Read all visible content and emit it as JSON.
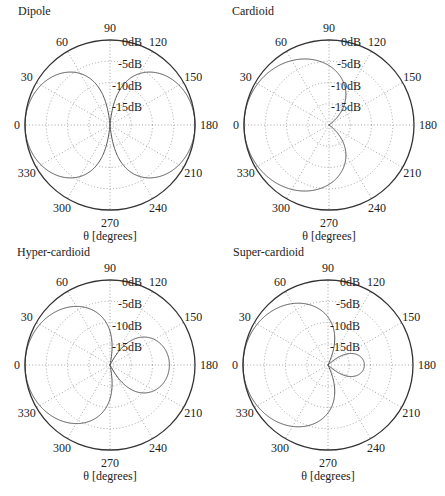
{
  "figure": {
    "angle_unit_label": "θ [degrees]"
  },
  "chart_data": [
    {
      "type": "polar",
      "title": "Dipole",
      "xlabel": "θ [degrees]",
      "pattern": {
        "a": 0.0,
        "b": 1.0,
        "formula": "|a + b·cos θ|"
      },
      "angle_ticks": [
        0,
        30,
        60,
        90,
        120,
        150,
        180,
        210,
        240,
        270,
        300,
        330
      ],
      "radial_ticks": [
        "0dB",
        "-5dB",
        "-10dB",
        "-15dB"
      ],
      "rlim_db": [
        -20,
        0
      ],
      "grid": true,
      "samples_deg": [
        0,
        30,
        60,
        90,
        120,
        150,
        180,
        210,
        240,
        270,
        300,
        330
      ],
      "values_db": [
        0,
        -1.25,
        -6.02,
        -20,
        -6.02,
        -1.25,
        0,
        -1.25,
        -6.02,
        -20,
        -6.02,
        -1.25
      ]
    },
    {
      "type": "polar",
      "title": "Cardioid",
      "xlabel": "θ [degrees]",
      "pattern": {
        "a": 0.5,
        "b": 0.5,
        "formula": "|a + b·cos θ|"
      },
      "angle_ticks": [
        0,
        30,
        60,
        90,
        120,
        150,
        180,
        210,
        240,
        270,
        300,
        330
      ],
      "radial_ticks": [
        "0dB",
        "-5dB",
        "-10dB",
        "-15dB"
      ],
      "rlim_db": [
        -20,
        0
      ],
      "grid": true,
      "samples_deg": [
        0,
        30,
        60,
        90,
        120,
        150,
        180,
        210,
        240,
        270,
        300,
        330
      ],
      "values_db": [
        0,
        -0.6,
        -2.5,
        -6.02,
        -12.04,
        -20,
        -20,
        -20,
        -12.04,
        -6.02,
        -2.5,
        -0.6
      ]
    },
    {
      "type": "polar",
      "title": "Hyper-cardioid",
      "xlabel": "θ [degrees]",
      "pattern": {
        "a": 0.25,
        "b": 0.75,
        "formula": "|a + b·cos θ|"
      },
      "angle_ticks": [
        0,
        30,
        60,
        90,
        120,
        150,
        180,
        210,
        240,
        270,
        300,
        330
      ],
      "radial_ticks": [
        "0dB",
        "-5dB",
        "-10dB",
        "-15dB"
      ],
      "rlim_db": [
        -20,
        0
      ],
      "grid": true,
      "samples_deg": [
        0,
        30,
        60,
        90,
        120,
        150,
        180,
        210,
        240,
        270,
        300,
        330
      ],
      "values_db": [
        0,
        -0.92,
        -4.08,
        -12.04,
        -18.06,
        -7.97,
        -6.02,
        -7.97,
        -18.06,
        -12.04,
        -4.08,
        -0.92
      ]
    },
    {
      "type": "polar",
      "title": "Super-cardioid",
      "xlabel": "θ [degrees]",
      "pattern": {
        "a": 0.366,
        "b": 0.634,
        "formula": "|a + b·cos θ|"
      },
      "angle_ticks": [
        0,
        30,
        60,
        90,
        120,
        150,
        180,
        210,
        240,
        270,
        300,
        330
      ],
      "radial_ticks": [
        "0dB",
        "-5dB",
        "-10dB",
        "-15dB"
      ],
      "rlim_db": [
        -20,
        0
      ],
      "grid": true,
      "samples_deg": [
        0,
        30,
        60,
        90,
        120,
        150,
        180,
        210,
        240,
        270,
        300,
        330
      ],
      "values_db": [
        0,
        -0.77,
        -3.31,
        -8.73,
        -20,
        -14.75,
        -11.44,
        -14.75,
        -20,
        -8.73,
        -3.31,
        -0.77
      ]
    }
  ],
  "layout": {
    "panels": [
      {
        "left": 0,
        "top": 0,
        "cx": 110,
        "cy": 125,
        "r": 85,
        "title_x": 18,
        "title_y": 4
      },
      {
        "left": 222,
        "top": 0,
        "cx": 107,
        "cy": 125,
        "r": 85,
        "title_x": 10,
        "title_y": 4
      },
      {
        "left": 0,
        "top": 243,
        "cx": 110,
        "cy": 122,
        "r": 85,
        "title_x": 17,
        "title_y": 2
      },
      {
        "left": 222,
        "top": 243,
        "cx": 106,
        "cy": 122,
        "r": 85,
        "title_x": 11,
        "title_y": 2
      }
    ]
  }
}
